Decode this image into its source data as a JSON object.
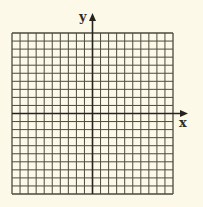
{
  "diagram": {
    "type": "coordinate-grid",
    "axes": {
      "x_label": "x",
      "y_label": "y"
    },
    "grid": {
      "columns": 20,
      "rows": 20,
      "columns_left_of_y_axis": 10,
      "rows_above_x_axis": 10,
      "labels_on_ticks": false
    },
    "colors": {
      "background": "#fcf9e8",
      "grid_line": "#4a4a3e",
      "axis_line": "#24231d"
    }
  }
}
